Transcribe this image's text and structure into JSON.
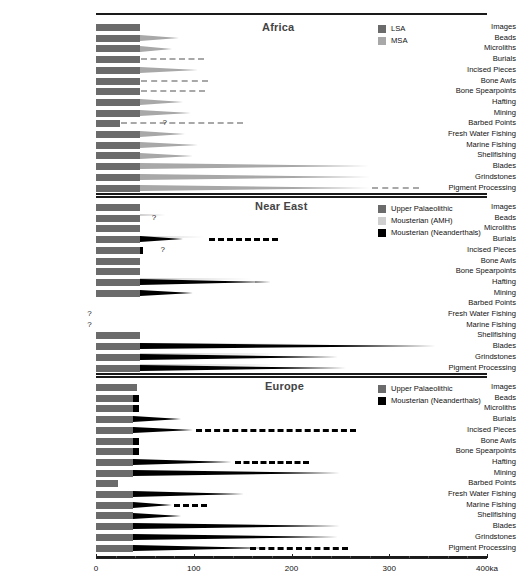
{
  "figure": {
    "axis": {
      "min": 0,
      "max": 400,
      "unit": "ka",
      "ticks": [
        0,
        100,
        200,
        300,
        400
      ],
      "tick_labels": [
        "0",
        "100",
        "200",
        "300",
        "400ka"
      ],
      "minor_tick_step": 20
    },
    "categories": [
      "Images",
      "Beads",
      "Microliths",
      "Burials",
      "Incised Pieces",
      "Bone Awls",
      "Bone Spearpoints",
      "Hafting",
      "Mining",
      "Barbed Points",
      "Fresh Water Fishing",
      "Marine Fishing",
      "Shellfishing",
      "Blades",
      "Grindstones",
      "Pigment Processing"
    ],
    "colors": {
      "lsa": "#6b6b6b",
      "msa": "#a8a8a8",
      "upper_palaeolithic": "#6b6b6b",
      "mousterian_amh": "#cfcfcf",
      "mousterian_neanderthals": "#000000",
      "rule": "#1a1a1a",
      "text": "#111111"
    }
  },
  "chart_data": {
    "type": "bar",
    "xlabel": "400ka",
    "ylabel": "",
    "xlim": [
      0,
      400
    ],
    "grid": false,
    "legend_position": "top-right",
    "panels": [
      {
        "name": "Africa",
        "title": "Africa",
        "legend": [
          {
            "label": "LSA",
            "color": "#6b6b6b"
          },
          {
            "label": "MSA",
            "color": "#a8a8a8"
          }
        ],
        "series": [
          {
            "name": "LSA",
            "color": "#6b6b6b",
            "values": [
              45,
              45,
              45,
              45,
              45,
              45,
              45,
              45,
              45,
              25,
              45,
              45,
              45,
              45,
              45,
              45
            ]
          },
          {
            "name": "MSA",
            "color": "#a8a8a8",
            "values": [
              0,
              85,
              78,
              0,
              105,
              0,
              0,
              90,
              98,
              0,
              92,
              105,
              100,
              280,
              281,
              281
            ],
            "dashed_to": [
              0,
              0,
              0,
              110,
              0,
              115,
              112,
              0,
              0,
              150,
              0,
              0,
              0,
              0,
              0,
              330
            ],
            "dashed_from": [
              0,
              0,
              0,
              46,
              0,
              46,
              46,
              0,
              0,
              26,
              0,
              0,
              0,
              0,
              0,
              282
            ]
          }
        ],
        "annotations": [
          {
            "category": "Barbed Points",
            "text": "?",
            "value": 68
          }
        ]
      },
      {
        "name": "Near East",
        "title": "Near East",
        "legend": [
          {
            "label": "Upper Palaeolithic",
            "color": "#6b6b6b"
          },
          {
            "label": "Mousterian (AMH)",
            "color": "#cfcfcf"
          },
          {
            "label": "Mousterian (Neanderthals)",
            "color": "#000000"
          }
        ],
        "series": [
          {
            "name": "Upper Palaeolithic",
            "color": "#6b6b6b",
            "values": [
              45,
              45,
              45,
              45,
              45,
              45,
              45,
              45,
              45,
              0,
              0,
              0,
              45,
              45,
              45,
              45
            ]
          },
          {
            "name": "Mousterian (AMH)",
            "color": "#cfcfcf",
            "values": [
              0,
              72,
              0,
              112,
              0,
              0,
              0,
              160,
              0,
              0,
              0,
              0,
              0,
              210,
              190,
              190
            ]
          },
          {
            "name": "Mousterian (Neanderthals)",
            "color": "#000000",
            "values": [
              0,
              0,
              0,
              90,
              28,
              0,
              0,
              180,
              100,
              0,
              0,
              0,
              0,
              348,
              248,
              256
            ],
            "dashed_to": [
              0,
              0,
              0,
              186,
              0,
              0,
              0,
              0,
              0,
              0,
              0,
              0,
              0,
              0,
              0,
              0
            ],
            "dashed_from": [
              0,
              0,
              0,
              116,
              0,
              0,
              0,
              0,
              0,
              0,
              0,
              0,
              0,
              0,
              0,
              0
            ]
          }
        ],
        "annotations": [
          {
            "category": "Beads",
            "text": "?",
            "value": 57
          },
          {
            "category": "Incised Pieces",
            "text": "?",
            "value": 66
          },
          {
            "category": "Fresh Water Fishing",
            "text": "?",
            "value": -9
          },
          {
            "category": "Marine Fishing",
            "text": "?",
            "value": -9
          }
        ]
      },
      {
        "name": "Europe",
        "title": "Europe",
        "legend": [
          {
            "label": "Upper Palaeolithic",
            "color": "#6b6b6b"
          },
          {
            "label": "Mousterian (Neanderthals)",
            "color": "#000000"
          }
        ],
        "series": [
          {
            "name": "Upper Palaeolithic",
            "color": "#6b6b6b",
            "values": [
              42,
              38,
              38,
              38,
              38,
              38,
              38,
              38,
              38,
              22,
              38,
              38,
              38,
              38,
              38,
              38
            ]
          },
          {
            "name": "Mousterian (Neanderthals)",
            "color": "#000000",
            "values": [
              0,
              44,
              44,
              88,
              100,
              44,
              44,
              140,
              250,
              0,
              152,
              78,
              88,
              250,
              248,
              180
            ],
            "dashed_to": [
              0,
              0,
              0,
              0,
              266,
              0,
              0,
              218,
              0,
              0,
              0,
              114,
              0,
              0,
              0,
              258
            ],
            "dashed_from": [
              0,
              0,
              0,
              0,
              102,
              0,
              0,
              142,
              0,
              0,
              0,
              80,
              0,
              0,
              0,
              158
            ]
          }
        ],
        "annotations": []
      }
    ]
  }
}
